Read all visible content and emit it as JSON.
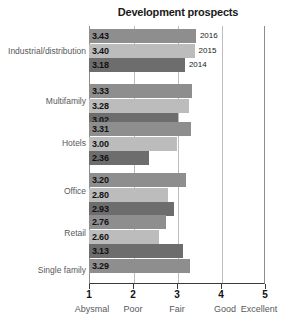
{
  "chart_data": {
    "type": "bar",
    "orientation": "horizontal",
    "title": "Development prospects",
    "xlabel": "",
    "ylabel": "",
    "xlim": [
      1,
      5
    ],
    "grid": true,
    "legend": "inline-year-labels",
    "categories": [
      "Industrial/distribution",
      "Multifamily",
      "Hotels",
      "Office",
      "Retail",
      "Single family"
    ],
    "series": [
      {
        "name": "2016",
        "color": "#8e8e8e",
        "values": [
          3.43,
          3.33,
          3.31,
          3.2,
          2.76,
          3.29
        ]
      },
      {
        "name": "2015",
        "color": "#bcbcbc",
        "values": [
          3.4,
          3.28,
          3.0,
          2.8,
          2.6,
          null
        ]
      },
      {
        "name": "2014",
        "color": "#6d6d6d",
        "values": [
          3.18,
          3.02,
          2.36,
          2.93,
          3.13,
          null
        ]
      }
    ],
    "xticks": [
      {
        "value": 1,
        "number": "1",
        "word": "Abysmal"
      },
      {
        "value": 2,
        "number": "2",
        "word": "Poor"
      },
      {
        "value": 3,
        "number": "3",
        "word": "Fair"
      },
      {
        "value": 4,
        "number": "4",
        "word": "Good"
      },
      {
        "value": 5,
        "number": "5",
        "word": "Excellent"
      }
    ],
    "value_labels": {
      "industrial_2016": "3.43",
      "industrial_2015": "3.40",
      "industrial_2014": "3.18",
      "multifamily_2016": "3.33",
      "multifamily_2015": "3.28",
      "multifamily_2014": "3.02",
      "hotels_2016": "3.31",
      "hotels_2015": "3.00",
      "hotels_2014": "2.36",
      "office_2016": "3.20",
      "office_2015": "2.80",
      "office_2014": "2.93",
      "retail_2016": "2.76",
      "retail_2015": "2.60",
      "retail_2014": "3.13",
      "single_family_2016": "3.29"
    },
    "year_labels": {
      "y2016": "2016",
      "y2015": "2015",
      "y2014": "2014"
    }
  }
}
